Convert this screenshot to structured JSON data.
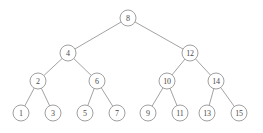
{
  "figure": {
    "background_color": "#ffffff",
    "node_stroke_color": "#8f8f8f",
    "node_fill_color": "#ffffff",
    "edge_color": "#8a8a8a",
    "label_color": "#4a4a4a",
    "node_radius": 8,
    "width": 263,
    "height": 133
  },
  "tree": {
    "root_value": "8",
    "depth": 4,
    "node_count": 15,
    "levels": [
      {
        "index": 0,
        "y": 18,
        "nodes": [
          {
            "id": "n8",
            "label": "8",
            "x": 128,
            "y": 18
          }
        ]
      },
      {
        "index": 1,
        "y": 53,
        "nodes": [
          {
            "id": "n4",
            "label": "4",
            "x": 68,
            "y": 53
          },
          {
            "id": "n12",
            "label": "12",
            "x": 190,
            "y": 53
          }
        ]
      },
      {
        "index": 2,
        "y": 81,
        "nodes": [
          {
            "id": "n2",
            "label": "2",
            "x": 38,
            "y": 81
          },
          {
            "id": "n6",
            "label": "6",
            "x": 97,
            "y": 81
          },
          {
            "id": "n10",
            "label": "10",
            "x": 167,
            "y": 81
          },
          {
            "id": "n14",
            "label": "14",
            "x": 216,
            "y": 81
          }
        ]
      },
      {
        "index": 3,
        "y": 113,
        "nodes": [
          {
            "id": "n1",
            "label": "1",
            "x": 21,
            "y": 113
          },
          {
            "id": "n3",
            "label": "3",
            "x": 53,
            "y": 113
          },
          {
            "id": "n5",
            "label": "5",
            "x": 85,
            "y": 113
          },
          {
            "id": "n7",
            "label": "7",
            "x": 117,
            "y": 113
          },
          {
            "id": "n9",
            "label": "9",
            "x": 148,
            "y": 113
          },
          {
            "id": "n11",
            "label": "11",
            "x": 180,
            "y": 113
          },
          {
            "id": "n13",
            "label": "13",
            "x": 207,
            "y": 113
          },
          {
            "id": "n15",
            "label": "15",
            "x": 239,
            "y": 113
          }
        ]
      }
    ],
    "edges": [
      {
        "from": "n8",
        "to": "n4"
      },
      {
        "from": "n8",
        "to": "n12"
      },
      {
        "from": "n4",
        "to": "n2"
      },
      {
        "from": "n4",
        "to": "n6"
      },
      {
        "from": "n12",
        "to": "n10"
      },
      {
        "from": "n12",
        "to": "n14"
      },
      {
        "from": "n2",
        "to": "n1"
      },
      {
        "from": "n2",
        "to": "n3"
      },
      {
        "from": "n6",
        "to": "n5"
      },
      {
        "from": "n6",
        "to": "n7"
      },
      {
        "from": "n10",
        "to": "n9"
      },
      {
        "from": "n10",
        "to": "n11"
      },
      {
        "from": "n14",
        "to": "n13"
      },
      {
        "from": "n14",
        "to": "n15"
      }
    ]
  }
}
